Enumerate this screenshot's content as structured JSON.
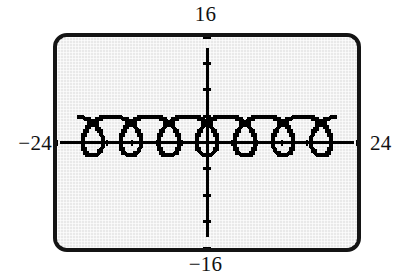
{
  "figure": {
    "kind": "graphing-calculator-screen"
  },
  "window_labels": {
    "ymax": "16",
    "ymin": "−16",
    "xmin": "−24",
    "xmax": "24"
  },
  "colors": {
    "screen_background": "#e9e9e9",
    "bezel": "#141414",
    "ink": "#000000",
    "page_background": "#ffffff"
  },
  "chart_data": {
    "type": "line",
    "title": "",
    "xlabel": "",
    "ylabel": "",
    "xlim": [
      -24,
      24
    ],
    "ylim": [
      -16,
      16
    ],
    "grid": false,
    "axes": {
      "x_axis_visible": true,
      "y_axis_visible": true,
      "x_tick_spacing": 4,
      "y_tick_spacing": 4,
      "x_ticks": [
        -24,
        -20,
        -16,
        -12,
        -8,
        -4,
        0,
        4,
        8,
        12,
        16,
        20,
        24
      ],
      "y_ticks": [
        -16,
        -12,
        -8,
        -4,
        0,
        4,
        8,
        12,
        16
      ]
    },
    "series": [
      {
        "name": "trochoid",
        "style": "pixelated-dashed",
        "parametric": {
          "x": "t - 3*sin(t)",
          "y": "1 - 3*cos(t)",
          "t_min": 0,
          "t_max": 44,
          "description": "prolate trochoid with 7 visible loops spanning x from about -21 to 21"
        },
        "loop_centers_x": [
          -18,
          -12,
          -6,
          0,
          6,
          12,
          18
        ],
        "loop_count": 7,
        "curve_y_top": 4,
        "curve_y_bottom": -2
      }
    ]
  }
}
